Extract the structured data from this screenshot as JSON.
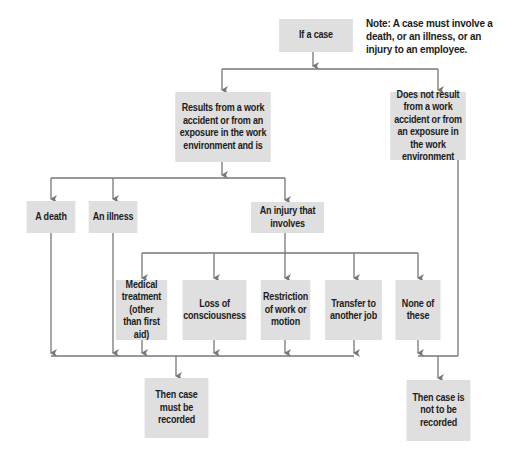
{
  "diagram": {
    "note": "Note: A case must involve a death, or an illness, or an injury to an employee.",
    "colors": {
      "box_fill": "#dfdfdf",
      "line": "#777777",
      "text": "#1c1c1c"
    },
    "nodes": {
      "start": {
        "label": "If a case"
      },
      "work_related": {
        "label": "Results from a work accident or from an exposure in the work environment and is"
      },
      "not_work_related": {
        "label": "Does not result from a work accident or from an exposure in the work environment"
      },
      "death": {
        "label": "A death"
      },
      "illness": {
        "label": "An illness"
      },
      "injury": {
        "label": "An injury that involves"
      },
      "medical": {
        "label": "Medical treatment (other than first aid)"
      },
      "consciousness": {
        "label": "Loss of consciousness"
      },
      "restriction": {
        "label": "Restriction of work or motion"
      },
      "transfer": {
        "label": "Transfer to another job"
      },
      "none": {
        "label": "None of these"
      },
      "recorded": {
        "label": "Then case must be recorded"
      },
      "not_recorded": {
        "label": "Then case is not to be recorded"
      }
    },
    "edges": [
      [
        "start",
        "work_related"
      ],
      [
        "start",
        "not_work_related"
      ],
      [
        "work_related",
        "death"
      ],
      [
        "work_related",
        "illness"
      ],
      [
        "work_related",
        "injury"
      ],
      [
        "injury",
        "medical"
      ],
      [
        "injury",
        "consciousness"
      ],
      [
        "injury",
        "restriction"
      ],
      [
        "injury",
        "transfer"
      ],
      [
        "injury",
        "none"
      ],
      [
        "death",
        "recorded"
      ],
      [
        "illness",
        "recorded"
      ],
      [
        "medical",
        "recorded"
      ],
      [
        "consciousness",
        "recorded"
      ],
      [
        "restriction",
        "recorded"
      ],
      [
        "transfer",
        "recorded"
      ],
      [
        "none",
        "not_recorded"
      ],
      [
        "not_work_related",
        "not_recorded"
      ]
    ]
  }
}
